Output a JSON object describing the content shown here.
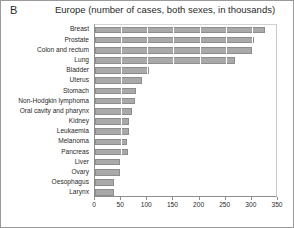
{
  "panel": {
    "label": "B"
  },
  "header": {
    "title": "Europe (number of cases, both sexes, in thousands)"
  },
  "axis": {
    "ticks": [
      "0",
      "50",
      "100",
      "150",
      "200",
      "250",
      "300",
      "350"
    ]
  },
  "chart_data": {
    "type": "bar",
    "orientation": "horizontal",
    "title": "Europe (number of cases, both sexes, in thousands)",
    "panel_label": "B",
    "xlabel": "",
    "ylabel": "",
    "xlim": [
      0,
      350
    ],
    "xticks": [
      0,
      50,
      100,
      150,
      200,
      250,
      300,
      350
    ],
    "grid": "vertical",
    "legend": "none",
    "bar_color": "#a9a9a9",
    "categories": [
      "Breast",
      "Prostate",
      "Colon and rectum",
      "Lung",
      "Bladder",
      "Uterus",
      "Stomach",
      "Non-Hodgkin lymphoma",
      "Oral cavity and pharynx",
      "Kidney",
      "Leukaemia",
      "Melanoma",
      "Pancreas",
      "Liver",
      "Ovary",
      "Oesophagus",
      "Larynx"
    ],
    "values": [
      325,
      305,
      300,
      268,
      103,
      90,
      78,
      76,
      71,
      65,
      65,
      61,
      63,
      48,
      48,
      36,
      36
    ],
    "units": "thousands of cases"
  }
}
